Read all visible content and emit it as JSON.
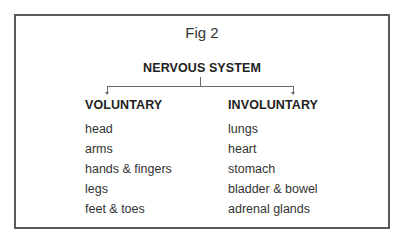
{
  "figure": {
    "title": "Fig 2",
    "root": "NERVOUS SYSTEM",
    "branches": [
      {
        "header": "VOLUNTARY",
        "items": [
          "head",
          "arms",
          "hands & fingers",
          "legs",
          "feet & toes"
        ]
      },
      {
        "header": "INVOLUNTARY",
        "items": [
          "lungs",
          "heart",
          "stomach",
          "bladder & bowel",
          "adrenal glands"
        ]
      }
    ]
  },
  "colors": {
    "border": "#5a5a5a",
    "text": "#222222",
    "connector": "#6a6a6a"
  }
}
